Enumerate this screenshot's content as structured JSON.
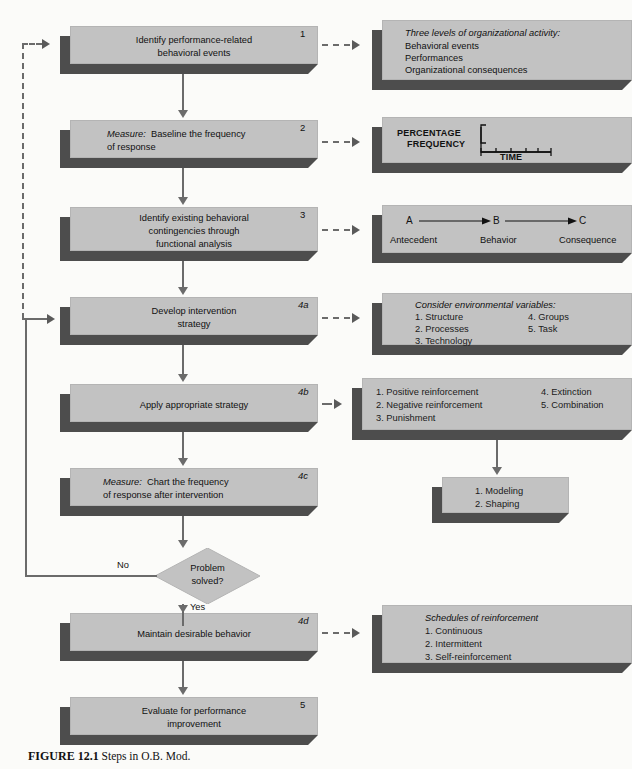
{
  "figure": {
    "label": "FIGURE 12.1",
    "caption": "Steps in O.B. Mod."
  },
  "steps": [
    {
      "id": "step-1",
      "number": "1",
      "number_style": "plain",
      "lines": [
        "Identify performance-related",
        "behavioral events"
      ],
      "align": "center"
    },
    {
      "id": "step-2",
      "number": "2",
      "number_style": "plain",
      "lines": [
        "Measure:  Baseline the frequency",
        "of response"
      ],
      "align": "left",
      "italic_prefix": "Measure:"
    },
    {
      "id": "step-3",
      "number": "3",
      "number_style": "plain",
      "lines": [
        "Identify existing behavioral",
        "contingencies through",
        "functional analysis"
      ],
      "align": "center"
    },
    {
      "id": "step-4a",
      "number": "4a",
      "number_style": "italic",
      "lines": [
        "Develop intervention",
        "strategy"
      ],
      "align": "center"
    },
    {
      "id": "step-4b",
      "number": "4b",
      "number_style": "italic",
      "lines": [
        "Apply appropriate strategy"
      ],
      "align": "center"
    },
    {
      "id": "step-4c",
      "number": "4c",
      "number_style": "italic",
      "lines": [
        "Measure:  Chart the frequency",
        "of response after intervention"
      ],
      "align": "left",
      "italic_prefix": "Measure:"
    },
    {
      "id": "step-4d",
      "number": "4d",
      "number_style": "italic",
      "lines": [
        "Maintain desirable behavior"
      ],
      "align": "center"
    },
    {
      "id": "step-5",
      "number": "5",
      "number_style": "plain",
      "lines": [
        "Evaluate for performance",
        "improvement"
      ],
      "align": "center"
    }
  ],
  "decision": {
    "lines": [
      "Problem",
      "solved?"
    ],
    "no_label": "No",
    "yes_label": "Yes"
  },
  "details": {
    "d1": {
      "heading": "Three levels of organizational activity:",
      "items": [
        "Behavioral events",
        "Performances",
        "Organizational consequences"
      ]
    },
    "d2": {
      "y_label_line1": "PERCENTAGE",
      "y_label_line2": "FREQUENCY",
      "x_label": "TIME"
    },
    "d3": {
      "a": "A",
      "b": "B",
      "c": "C",
      "antecedent": "Antecedent",
      "behavior": "Behavior",
      "consequence": "Consequence"
    },
    "d4a": {
      "heading": "Consider environmental variables:",
      "left": [
        "1.  Structure",
        "2.  Processes",
        "3.  Technology"
      ],
      "right": [
        "4.  Groups",
        "5.  Task"
      ]
    },
    "d4b": {
      "left": [
        "1.  Positive reinforcement",
        "2.  Negative reinforcement",
        "3.  Punishment"
      ],
      "right": [
        "4.  Extinction",
        "5.  Combination"
      ]
    },
    "d4b_sub": {
      "items": [
        "1.  Modeling",
        "2.  Shaping"
      ]
    },
    "d4d": {
      "heading": "Schedules of reinforcement",
      "items": [
        "1.  Continuous",
        "2.  Intermittent",
        "3.  Self-reinforcement"
      ]
    }
  },
  "colors": {
    "box_face": "#c2c2c2",
    "box_shadow": "#4d4d4d",
    "connector": "#6b6b6b",
    "background": "#fbfbf9"
  }
}
